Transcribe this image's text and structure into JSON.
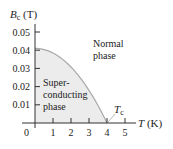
{
  "chart_data": {
    "type": "area",
    "title": "",
    "xlabel": "T (K)",
    "ylabel": "B_c (T)",
    "xlim": [
      0,
      5.6
    ],
    "ylim": [
      0,
      0.056
    ],
    "x_ticks": [
      1,
      2,
      3,
      4,
      5
    ],
    "x_tick_labels": [
      "1",
      "2",
      "3",
      "4",
      "5"
    ],
    "y_ticks": [
      0.01,
      0.02,
      0.03,
      0.04,
      0.05
    ],
    "y_tick_labels": [
      "0.01",
      "0.02",
      "0.03",
      "0.04",
      "0.05"
    ],
    "origin_label": "0",
    "grid": false,
    "series": [
      {
        "name": "Critical field curve",
        "x": [
          0,
          0.5,
          1.0,
          1.5,
          2.0,
          2.5,
          3.0,
          3.5,
          3.75,
          4.0
        ],
        "values": [
          0.041,
          0.0404,
          0.0384,
          0.0352,
          0.0308,
          0.025,
          0.0179,
          0.0096,
          0.005,
          0.0
        ]
      }
    ],
    "annotations": [
      {
        "text_lines": [
          "Super-",
          "conducting",
          "phase"
        ],
        "region": "below curve"
      },
      {
        "text_lines": [
          "Normal",
          "phase"
        ],
        "region": "above curve"
      },
      {
        "text": "T_c",
        "points_to": [
          4.0,
          0
        ]
      }
    ],
    "Bc0": 0.041,
    "Tc": 4.0
  },
  "labels": {
    "y_axis_symbol": "B",
    "y_axis_sub": "c",
    "y_axis_unit": " (T)",
    "x_axis_symbol": "T",
    "x_axis_unit": " (K)",
    "tc_symbol": "T",
    "tc_sub": "c",
    "super_line1": "Super-",
    "super_line2": "conducting",
    "super_line3": "phase",
    "normal_line1": "Normal",
    "normal_line2": "phase",
    "origin": "0",
    "x1": "1",
    "x2": "2",
    "x3": "3",
    "x4": "4",
    "x5": "5",
    "y1": "0.01",
    "y2": "0.02",
    "y3": "0.03",
    "y4": "0.04",
    "y5": "0.05"
  },
  "colors": {
    "fill": "#ececec",
    "curve": "#a8a8a8",
    "axis": "#333333",
    "text": "#222222"
  }
}
